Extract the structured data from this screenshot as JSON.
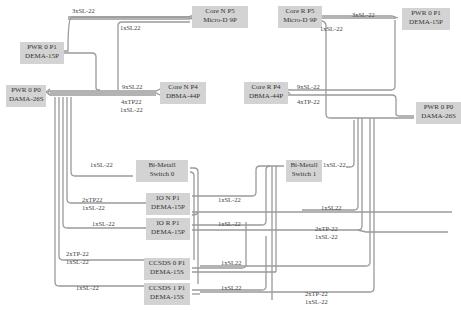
{
  "colors": {
    "box_fill": "#d3d3d3",
    "wire": "#9a9a9a",
    "text": "#333333"
  },
  "boxes": {
    "core_n_p5": {
      "line1": "Core N P5",
      "line2": "Micro-D 9P"
    },
    "core_r_p5": {
      "line1": "Core R P5",
      "line2": "Micro-D 9P"
    },
    "pwr0_p1_left": {
      "line1": "PWR 0 P1",
      "line2": "DEMA-15P"
    },
    "pwr0_p1_right": {
      "line1": "PWR 0 P1",
      "line2": "DEMA-15P"
    },
    "pwr0_p0_left": {
      "line1": "PWR 0 P0",
      "line2": "DAMA-26S"
    },
    "pwr0_p0_right": {
      "line1": "PWR 0 P0",
      "line2": "DAMA-26S"
    },
    "core_n_p4": {
      "line1": "Core N P4",
      "line2": "DBMA-44P"
    },
    "core_r_p4": {
      "line1": "Core R P4",
      "line2": "DBMA-44P"
    },
    "bimetall_0": {
      "line1": "Bi-Metall",
      "line2": "Switch 0"
    },
    "bimetall_1": {
      "line1": "Bi-Metall",
      "line2": "Switch 1"
    },
    "io_n_p1": {
      "line1": "IO N P1",
      "line2": "DEMA-15P"
    },
    "io_r_p1": {
      "line1": "IO R P1",
      "line2": "DEMA-15P"
    },
    "ccsds0_p1": {
      "line1": "CCSDS 0 P1",
      "line2": "DEMA-15S"
    },
    "ccsds1_p1": {
      "line1": "CCSDS 1 P1",
      "line2": "DEMA-15S"
    }
  },
  "labels": {
    "l1": "3xSL-22",
    "l2": "1xSL22",
    "l3": "9xSL22",
    "l4a": "4xTP22",
    "l4b": "1xSL-22",
    "l5": "3xSL-22",
    "l6": "1xSL-22",
    "l7": "9xSL-22",
    "l8": "4xTP-22",
    "l9": "1xSL-22",
    "l10": "1xSL-22",
    "l11a": "2xTP22",
    "l11b": "1xSL-22",
    "l12": "1xSL-22",
    "l13": "1xSL-22",
    "l14": "1xSL-22",
    "l15a": "2xTP-22",
    "l15b": "1xSL-22",
    "l16": "1xSL-22",
    "l17": "1xSL22",
    "l18a": "2xTP-22",
    "l18b": "1xSL-22",
    "l19": "1xSL22",
    "l20": "1xSL22",
    "l21a": "2xTP-22",
    "l21b": "1xSL-22"
  }
}
